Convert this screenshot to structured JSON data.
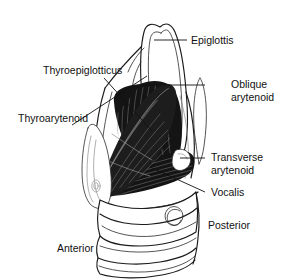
{
  "figure": {
    "width": 291,
    "height": 280,
    "background_color": "#ffffff",
    "line_color": "#111111",
    "muscle_color": "#141414",
    "cartilage_color": "#ffffff"
  },
  "labels": {
    "epiglottis": "Epiglottis",
    "thyroepiglotticus": "Thyroepiglotticus",
    "thyroarytenoid": "Thyroarytenoid",
    "oblique_arytenoid_line1": "Oblique",
    "oblique_arytenoid_line2": "arytenoid",
    "transverse_arytenoid_line1": "Transverse",
    "transverse_arytenoid_line2": "arytenoid",
    "vocalis": "Vocalis",
    "posterior": "Posterior",
    "anterior": "Anterior"
  },
  "structures": [
    {
      "name": "epiglottis",
      "label": "Epiglottis",
      "type": "cartilage",
      "side": "right",
      "leader_from": [
        187,
        40
      ],
      "leader_to": [
        154,
        40
      ]
    },
    {
      "name": "thyroepiglotticus",
      "label": "Thyroepiglotticus",
      "type": "muscle",
      "side": "left",
      "leader_from": [
        104,
        76
      ],
      "leader_to": [
        152,
        130
      ]
    },
    {
      "name": "thyroarytenoid",
      "label": "Thyroarytenoid",
      "type": "muscle",
      "side": "left",
      "leader_from": [
        74,
        124
      ],
      "leader_to": [
        146,
        76
      ]
    },
    {
      "name": "oblique-arytenoid",
      "label": "Oblique arytenoid",
      "type": "muscle",
      "side": "right",
      "leader_from": [
        205,
        85
      ],
      "leader_to": [
        141,
        85
      ]
    },
    {
      "name": "transverse-arytenoid",
      "label": "Transverse arytenoid",
      "type": "muscle",
      "side": "right",
      "leader_from": [
        205,
        158
      ],
      "leader_to": [
        182,
        158
      ]
    },
    {
      "name": "vocalis",
      "label": "Vocalis",
      "type": "muscle",
      "side": "right",
      "leader_from": [
        205,
        192
      ],
      "leader_to": [
        150,
        167
      ]
    }
  ],
  "orientation": {
    "anterior": "Anterior",
    "posterior": "Posterior"
  }
}
